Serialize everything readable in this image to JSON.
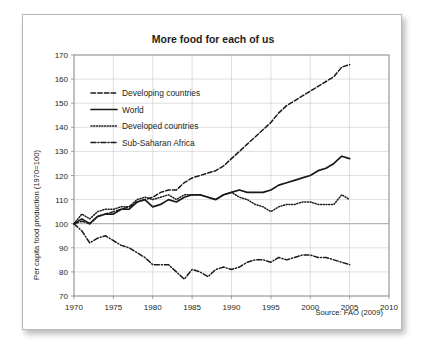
{
  "figure": {
    "title": "More food for each of us",
    "source": "Source: FAO (2009)",
    "ylabel": "Per capita food production (1970=100)"
  },
  "chart_data": {
    "type": "line",
    "title": "More food for each of us",
    "xlabel": "",
    "ylabel": "Per capita food production (1970=100)",
    "source": "Source: FAO (2009)",
    "xlim": [
      1970,
      2010
    ],
    "ylim": [
      70,
      170
    ],
    "xticks": [
      1970,
      1975,
      1980,
      1985,
      1990,
      1995,
      2000,
      2005,
      2010
    ],
    "yticks": [
      70,
      80,
      90,
      100,
      110,
      120,
      130,
      140,
      150,
      160,
      170
    ],
    "grid": true,
    "legend_position": "upper left",
    "x": [
      1970,
      1971,
      1972,
      1973,
      1974,
      1975,
      1976,
      1977,
      1978,
      1979,
      1980,
      1981,
      1982,
      1983,
      1984,
      1985,
      1986,
      1987,
      1988,
      1989,
      1990,
      1991,
      1992,
      1993,
      1994,
      1995,
      1996,
      1997,
      1998,
      1999,
      2000,
      2001,
      2002,
      2003,
      2004,
      2005
    ],
    "series": [
      {
        "name": "Developing countries",
        "style": "dashed",
        "color": "#1a1a1a",
        "values": [
          100,
          101,
          100,
          103,
          104,
          105,
          106,
          107,
          109,
          110,
          111,
          113,
          114,
          114,
          117,
          119,
          120,
          121,
          122,
          124,
          127,
          130,
          133,
          136,
          139,
          142,
          146,
          149,
          151,
          153,
          155,
          157,
          159,
          161,
          165,
          166
        ]
      },
      {
        "name": "World",
        "style": "solid",
        "color": "#1a1a1a",
        "values": [
          100,
          102,
          100,
          103,
          104,
          104,
          106,
          106,
          109,
          110,
          107,
          108,
          110,
          109,
          111,
          112,
          112,
          111,
          110,
          112,
          113,
          114,
          113,
          113,
          113,
          114,
          116,
          117,
          118,
          119,
          120,
          122,
          123,
          125,
          128,
          127
        ]
      },
      {
        "name": "Developed countries",
        "style": "dotted",
        "color": "#1a1a1a",
        "values": [
          100,
          104,
          102,
          105,
          106,
          106,
          107,
          107,
          110,
          111,
          110,
          111,
          112,
          110,
          112,
          112,
          112,
          111,
          110,
          112,
          113,
          111,
          110,
          108,
          107,
          105,
          107,
          108,
          108,
          109,
          109,
          108,
          108,
          108,
          112,
          110
        ]
      },
      {
        "name": "Sub-Saharan Africa",
        "style": "dashdot",
        "color": "#1a1a1a",
        "values": [
          100,
          97,
          92,
          94,
          95,
          93,
          91,
          90,
          88,
          86,
          83,
          83,
          83,
          80,
          77,
          81,
          80,
          78,
          81,
          82,
          81,
          82,
          84,
          85,
          85,
          84,
          86,
          85,
          86,
          87,
          87,
          86,
          86,
          85,
          84,
          83
        ]
      }
    ]
  },
  "legend": {
    "items": [
      {
        "label": "Developing countries",
        "style": "dashed"
      },
      {
        "label": "World",
        "style": "solid"
      },
      {
        "label": "Developed countries",
        "style": "dotted"
      },
      {
        "label": "Sub-Saharan Africa",
        "style": "dashdot"
      }
    ]
  }
}
